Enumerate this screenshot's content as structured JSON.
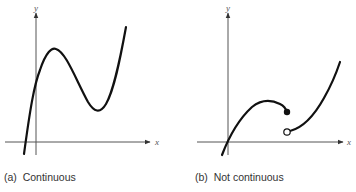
{
  "panels": [
    {
      "caption": "(a)  Continuous",
      "x_axis_label": "x",
      "y_axis_label": "y",
      "description": "Cubic-like continuous curve with a local max and local min"
    },
    {
      "caption": "(b)  Not continuous",
      "x_axis_label": "x",
      "y_axis_label": "y",
      "description": "Curve with a jump discontinuity: closed dot on left piece, open circle on right piece"
    }
  ],
  "colors": {
    "curve": "#111111",
    "axis": "#555555",
    "background": "#ffffff"
  }
}
